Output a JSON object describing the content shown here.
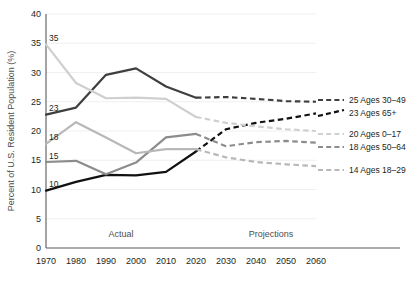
{
  "chart_data": {
    "type": "line",
    "title": "",
    "xlabel": "",
    "ylabel": "Percent of U.S. Resident Population (%)",
    "x": [
      1970,
      1980,
      1990,
      2000,
      2010,
      2020,
      2030,
      2040,
      2050,
      2060
    ],
    "xlim": [
      1970,
      2060
    ],
    "ylim": [
      0,
      40
    ],
    "ytick_labels": [
      "0",
      "5",
      "10",
      "15",
      "20",
      "25",
      "30",
      "35",
      "40"
    ],
    "yticks": [
      0,
      5,
      10,
      15,
      20,
      25,
      30,
      35,
      40
    ],
    "xtick_labels": [
      "1970",
      "1980",
      "1990",
      "2000",
      "2010",
      "2020",
      "2030",
      "2040",
      "2050",
      "2060"
    ],
    "grid": "horizontal",
    "legend_position": "right",
    "actual_projection_split_year": 2020,
    "annotations": [
      {
        "name": "actual-label",
        "text": "Actual",
        "x": 1995
      },
      {
        "name": "projections-label",
        "text": "Projections",
        "x": 2045
      }
    ],
    "series": [
      {
        "name": "Ages 30–49",
        "legend_value": "25",
        "legend_text": "25 Ages 30–49",
        "start_label": "23",
        "color": "#3f3f3f",
        "width": 2.2,
        "values": [
          22.8,
          24.0,
          29.6,
          30.7,
          27.6,
          25.7,
          25.8,
          25.5,
          25.1,
          25.0
        ]
      },
      {
        "name": "Ages 65+",
        "legend_value": "23",
        "legend_text": "23 Ages 65+",
        "start_label": "10",
        "color": "#111111",
        "width": 2.2,
        "values": [
          9.8,
          11.3,
          12.5,
          12.4,
          13.0,
          16.5,
          20.3,
          21.4,
          22.1,
          23.0
        ]
      },
      {
        "name": "Ages 0–17",
        "legend_value": "20",
        "legend_text": "20 Ages 0–17",
        "start_label": "35",
        "color": "#cfcfcf",
        "width": 2.2,
        "values": [
          34.8,
          28.2,
          25.6,
          25.7,
          25.5,
          22.4,
          21.4,
          20.8,
          20.3,
          20.0
        ]
      },
      {
        "name": "Ages 50–64",
        "legend_value": "18",
        "legend_text": "18 Ages 50–64",
        "start_label": "15",
        "color": "#8c8c8c",
        "width": 2.2,
        "values": [
          14.7,
          14.9,
          12.6,
          14.6,
          18.9,
          19.5,
          17.4,
          18.1,
          18.3,
          18.0
        ]
      },
      {
        "name": "Ages 18–29",
        "legend_value": "14",
        "legend_text": "14 Ages 18–29",
        "start_label": "18",
        "color": "#b8b8b8",
        "width": 2.2,
        "values": [
          17.8,
          21.5,
          18.9,
          16.2,
          16.9,
          16.9,
          15.5,
          14.7,
          14.3,
          14.0
        ]
      }
    ]
  },
  "layout": {
    "plot_left": 46,
    "plot_right": 316,
    "plot_top": 14,
    "plot_bottom": 248,
    "legend_x": 318,
    "legend_rows": [
      {
        "series": 0,
        "y": 100
      },
      {
        "series": 1,
        "y": 113
      },
      {
        "series": 2,
        "y": 134
      },
      {
        "series": 3,
        "y": 147
      },
      {
        "series": 4,
        "y": 170
      }
    ]
  }
}
